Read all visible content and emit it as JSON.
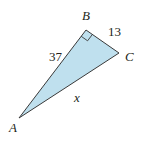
{
  "diagram": {
    "type": "right-triangle",
    "fill_color": "#bfe0ee",
    "stroke_color": "#3a3a3a",
    "vertices": {
      "A": {
        "label": "A"
      },
      "B": {
        "label": "B",
        "right_angle": true
      },
      "C": {
        "label": "C"
      }
    },
    "sides": {
      "AB": {
        "label": "37"
      },
      "BC": {
        "label": "13"
      },
      "AC": {
        "label": "x"
      }
    }
  }
}
